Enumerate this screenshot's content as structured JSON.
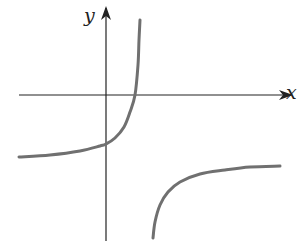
{
  "chart_data": {
    "type": "line",
    "title": "",
    "xlabel": "x",
    "ylabel": "y",
    "grid": false,
    "legend": null,
    "axes": {
      "x_axis_y_px": 95,
      "y_axis_x_px": 106,
      "x_range_px": [
        19,
        291
      ],
      "y_range_px": [
        8,
        241
      ]
    },
    "features": {
      "vertical_asymptote": "x = a (a > 0), just right of the y-axis",
      "horizontal_asymptote": "y = b (b < 0)",
      "x_intercept": "positive, just left of the vertical asymptote",
      "y_intercept": "negative, above the horizontal asymptote"
    },
    "series": [
      {
        "name": "left-branch",
        "points_px": [
          [
            19,
            157
          ],
          [
            50,
            155
          ],
          [
            80,
            151
          ],
          [
            100,
            146
          ],
          [
            106,
            144
          ],
          [
            115,
            138
          ],
          [
            124,
            127
          ],
          [
            130,
            112
          ],
          [
            135,
            95
          ],
          [
            138,
            65
          ],
          [
            139,
            40
          ],
          [
            140,
            20
          ]
        ]
      },
      {
        "name": "right-branch",
        "points_px": [
          [
            153,
            238
          ],
          [
            155,
            222
          ],
          [
            160,
            205
          ],
          [
            168,
            192
          ],
          [
            180,
            182
          ],
          [
            200,
            174
          ],
          [
            225,
            170
          ],
          [
            250,
            167
          ],
          [
            280,
            166
          ]
        ]
      }
    ],
    "colors": {
      "axes": "#222222",
      "curve": "#707070"
    }
  },
  "labels": {
    "x_axis": "x",
    "y_axis": "y"
  }
}
